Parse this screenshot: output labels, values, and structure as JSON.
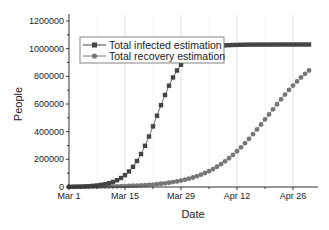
{
  "chart_data": {
    "type": "line",
    "title": "",
    "xlabel": "Date",
    "ylabel": "People",
    "x_tick_labels": [
      "Mar 1",
      "Mar 15",
      "Mar 29",
      "Apr 12",
      "Apr 26"
    ],
    "y_tick_labels": [
      "0",
      "200000",
      "400000",
      "600000",
      "800000",
      "1000000",
      "1200000"
    ],
    "ylim": [
      0,
      1200000
    ],
    "xlim_days": [
      0,
      62
    ],
    "x_start": "Mar 1",
    "x_end": "Apr 30",
    "grid": {
      "vertical": true,
      "horizontal": false
    },
    "legend_position": "upper-left",
    "series": [
      {
        "name": "Total infected estimation",
        "marker": "square",
        "color": "#444444",
        "values": [
          1406,
          1897,
          2560,
          3453,
          4658,
          6281,
          8466,
          11405,
          15351,
          20637,
          27697,
          37076,
          49455,
          65637,
          86528,
          113084,
          146166,
          186312,
          233512,
          287040,
          345395,
          406400,
          467500,
          526158,
          580226,
          628204,
          669323,
          703480,
          731096,
          752978,
          770123,
          783431,
          793665,
          801479,
          807412,
          811906,
          815297,
          817851,
          819771,
          821213,
          822294,
          823104,
          823711,
          824165,
          824505,
          824759,
          824949,
          825091,
          825198,
          825277,
          825337,
          825381,
          825415,
          825440,
          825458,
          825472,
          825483,
          825490,
          825496,
          825500,
          825504
        ],
        "note": "values scaled below"
      },
      {
        "name": "Total recovery estimation",
        "marker": "circle",
        "color": "#777777"
      }
    ]
  },
  "legend": {
    "items": [
      {
        "label": "Total infected estimation",
        "marker": "square",
        "color": "#444444"
      },
      {
        "label": "Total recovery estimation",
        "marker": "circle",
        "color": "#777777"
      }
    ]
  },
  "axes": {
    "x_title": "Date",
    "y_title": "People",
    "x_ticks": [
      "Mar 1",
      "Mar 15",
      "Mar 29",
      "Apr 12",
      "Apr 26"
    ],
    "y_ticks": [
      "0",
      "200000",
      "400000",
      "600000",
      "800000",
      "1000000",
      "1200000"
    ]
  },
  "model": {
    "infected": {
      "K": 1030000,
      "mid_day": 22,
      "rate": 0.3
    },
    "recovery": {
      "K": 1050000,
      "mid_day": 50,
      "rate": 0.14
    },
    "days": 61
  }
}
